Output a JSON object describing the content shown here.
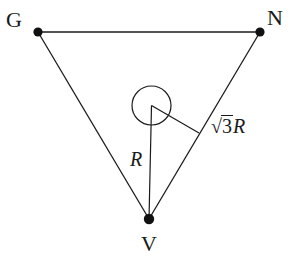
{
  "figure": {
    "type": "geometry-diagram",
    "background_color": "#ffffff",
    "stroke_color": "#1a1a1a",
    "vertices": [
      {
        "id": "G",
        "label": "G",
        "x": 38,
        "y": 32,
        "label_x": 17,
        "label_y": 20
      },
      {
        "id": "N",
        "label": "N",
        "x": 260,
        "y": 32,
        "label_x": 277,
        "label_y": 18
      },
      {
        "id": "V",
        "label": "V",
        "x": 149,
        "y": 219,
        "label_x": 150,
        "label_y": 244
      }
    ],
    "edges": [
      {
        "from": "G",
        "to": "N"
      },
      {
        "from": "N",
        "to": "V"
      },
      {
        "from": "V",
        "to": "G"
      }
    ],
    "circle": {
      "cx": 151.5,
      "cy": 105.5,
      "r": 19.5
    },
    "segments": [
      {
        "id": "segment-R",
        "label": "R",
        "from_x": 151.5,
        "from_y": 105.5,
        "to_x": 149,
        "to_y": 219,
        "label_x": 138,
        "label_y": 160
      },
      {
        "id": "segment-sqrt3R",
        "label": "√3R",
        "label_parts": {
          "radical": "√",
          "radicand": "3",
          "variable": "R"
        },
        "from_x": 151.5,
        "from_y": 105.5,
        "to_x": 199,
        "to_y": 133,
        "label_x": 232,
        "label_y": 126
      }
    ]
  }
}
